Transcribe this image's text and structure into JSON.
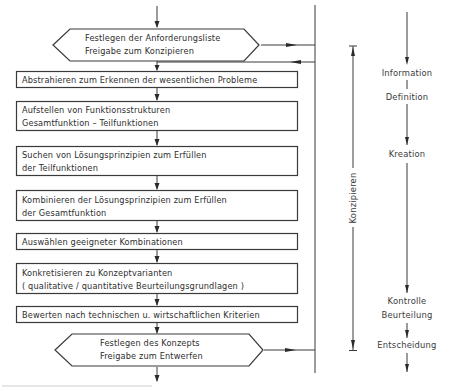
{
  "diagram": {
    "type": "flowchart",
    "steps": [
      {
        "id": "hex1",
        "shape": "hexagon",
        "lines": [
          "Festlegen der Anforderungsliste",
          "Freigabe zum Konzipieren"
        ]
      },
      {
        "id": "s1",
        "shape": "rect",
        "lines": [
          "Abstrahieren zum Erkennen der wesentlichen Probleme"
        ]
      },
      {
        "id": "s2",
        "shape": "rect",
        "lines": [
          "Aufstellen von Funktionsstrukturen",
          "Gesamtfunktion – Teilfunktionen"
        ]
      },
      {
        "id": "s3",
        "shape": "rect",
        "lines": [
          "Suchen von Lösungsprinzipien zum Erfüllen",
          "der Teilfunktionen"
        ]
      },
      {
        "id": "s4",
        "shape": "rect",
        "lines": [
          "Kombinieren der Lösungsprinzipien zum Erfüllen",
          "der Gesamtfunktion"
        ]
      },
      {
        "id": "s5",
        "shape": "rect",
        "lines": [
          "Auswählen geeigneter Kombinationen"
        ]
      },
      {
        "id": "s6",
        "shape": "rect",
        "lines": [
          "Konkretisieren zu Konzeptvarianten",
          "( qualitative / quantitative Beurteilungsgrundlagen )"
        ]
      },
      {
        "id": "s7",
        "shape": "rect",
        "lines": [
          "Bewerten nach technischen u. wirtschaftlichen Kriterien"
        ]
      },
      {
        "id": "hex2",
        "shape": "hexagon",
        "lines": [
          "Festlegen des Konzepts",
          "Freigabe zum Entwerfen"
        ]
      }
    ],
    "phase_bracket": {
      "label": "Konzipieren"
    },
    "activity_column": {
      "labels": {
        "information": "Information",
        "definition": "Definition",
        "kreation": "Kreation",
        "kontrolle": "Kontrolle",
        "beurteilung": "Beurteilung",
        "entscheidung": "Entscheidung"
      }
    }
  }
}
